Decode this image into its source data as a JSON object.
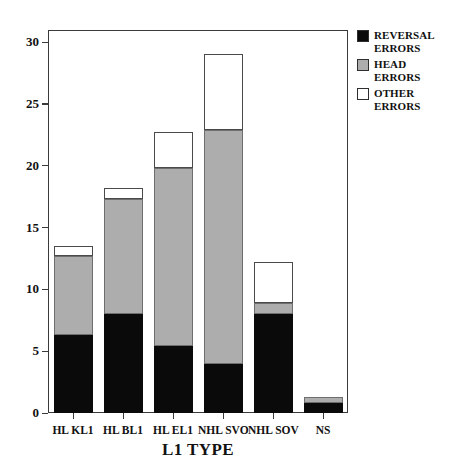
{
  "chart_data": {
    "type": "bar",
    "subtype": "stacked-bar",
    "title": "",
    "xlabel": "L1 TYPE",
    "ylabel": "",
    "categories": [
      "HL KL1",
      "HL BL1",
      "HL EL1",
      "NHL SVO",
      "NHL SOV",
      "NS"
    ],
    "series": [
      {
        "name": "REVERSAL ERRORS",
        "color": "#0a0a0a",
        "values": [
          6.3,
          8.0,
          5.4,
          4.0,
          8.0,
          0.8
        ]
      },
      {
        "name": "HEAD ERRORS",
        "color": "#adadad",
        "values": [
          6.4,
          9.3,
          14.4,
          18.9,
          0.9,
          0.5
        ]
      },
      {
        "name": "OTHER ERRORS",
        "color": "#ffffff",
        "values": [
          0.8,
          0.9,
          2.9,
          6.1,
          3.3,
          0.0
        ]
      }
    ],
    "cumulative_tops": [
      [
        6.3,
        12.7,
        13.5
      ],
      [
        8.0,
        17.3,
        18.2
      ],
      [
        5.4,
        19.8,
        22.7
      ],
      [
        4.0,
        22.9,
        29.0
      ],
      [
        8.0,
        8.9,
        12.2
      ],
      [
        0.8,
        1.3,
        1.3
      ]
    ],
    "totals": [
      13.5,
      18.2,
      22.7,
      29.0,
      12.2,
      1.3
    ],
    "ylim": [
      0,
      31
    ],
    "yticks": [
      0,
      5,
      10,
      15,
      20,
      25,
      30
    ],
    "ytick_labels": [
      "0",
      "5",
      "10",
      "15",
      "20",
      "25",
      "30"
    ],
    "grid": false,
    "legend_position": "outside-top-right"
  },
  "axes": {
    "y_ticks": [
      {
        "value": 30,
        "label": "30"
      },
      {
        "value": 25,
        "label": "25"
      },
      {
        "value": 20,
        "label": "20"
      },
      {
        "value": 15,
        "label": "15"
      },
      {
        "value": 10,
        "label": "10"
      },
      {
        "value": 5,
        "label": "5"
      },
      {
        "value": 0,
        "label": "0"
      }
    ],
    "x_labels": [
      "HL KL1",
      "HL BL1",
      "HL EL1",
      "NHL SVO",
      "NHL SOV",
      "NS"
    ],
    "x_title": "L1 TYPE"
  },
  "legend": {
    "items": [
      {
        "label": "REVERSAL\nERRORS",
        "color": "#0a0a0a",
        "swatch": "reversal-errors-swatch"
      },
      {
        "label": "HEAD ERRORS",
        "color": "#adadad",
        "swatch": "head-errors-swatch"
      },
      {
        "label": "OTHER ERRORS",
        "color": "#ffffff",
        "swatch": "other-errors-swatch"
      }
    ]
  }
}
